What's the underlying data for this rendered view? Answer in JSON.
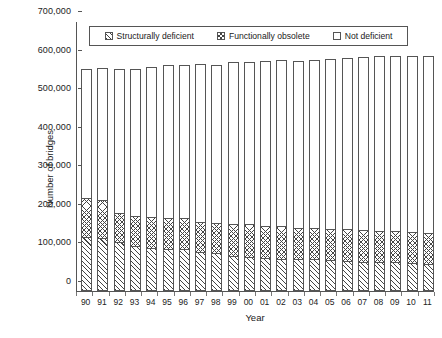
{
  "chart_data": {
    "type": "bar",
    "stacked": true,
    "title": "",
    "xlabel": "Year",
    "ylabel": "Number of bridges",
    "ylim": [
      0,
      700000
    ],
    "ytick_step": 100000,
    "ytick_labels": [
      "0",
      "100,000",
      "200,000",
      "300,000",
      "400,000",
      "500,000",
      "600,000",
      "700,000"
    ],
    "ytick_values": [
      0,
      100000,
      200000,
      300000,
      400000,
      500000,
      600000,
      700000
    ],
    "grid": false,
    "legend_position": "top-inside",
    "categories": [
      "90",
      "91",
      "92",
      "93",
      "94",
      "95",
      "96",
      "97",
      "98",
      "99",
      "00",
      "01",
      "02",
      "03",
      "04",
      "05",
      "06",
      "07",
      "08",
      "09",
      "10",
      "11"
    ],
    "series": [
      {
        "name": "Structurally deficient",
        "pattern": "diagonal-hatch",
        "values": [
          137400,
          134800,
          124500,
          114900,
          109800,
          107200,
          106400,
          98500,
          95500,
          88900,
          85600,
          82900,
          81300,
          79600,
          80100,
          76600,
          74800,
          73100,
          72500,
          71500,
          69200,
          67500
        ]
      },
      {
        "name": "Functionally obsolete",
        "pattern": "crosshatch",
        "values": [
          101100,
          98300,
          76300,
          78200,
          80300,
          79300,
          79900,
          79000,
          79200,
          82800,
          85900,
          84200,
          84000,
          82400,
          80400,
          81800,
          82300,
          81600,
          80700,
          80400,
          80300,
          80800
        ]
      },
      {
        "name": "Not deficient",
        "pattern": "solid-white",
        "values": [
          333500,
          341900,
          372200,
          380900,
          388900,
          397500,
          396700,
          407500,
          409300,
          418300,
          420500,
          426900,
          430700,
          433000,
          436500,
          439600,
          444900,
          449300,
          452800,
          456100,
          456500,
          459700
        ]
      }
    ],
    "totals": [
      572000,
      575000,
      573000,
      574000,
      579000,
      584000,
      583000,
      585000,
      584000,
      590000,
      592000,
      594000,
      596000,
      595000,
      597000,
      598000,
      602000,
      604000,
      606000,
      608000,
      606000,
      608000
    ]
  },
  "legend": {
    "items": [
      {
        "label": "Structurally deficient",
        "pattern": "structurally-deficient"
      },
      {
        "label": "Functionally obsolete",
        "pattern": "functionally-obsolete"
      },
      {
        "label": "Not deficient",
        "pattern": "not-deficient"
      }
    ]
  }
}
